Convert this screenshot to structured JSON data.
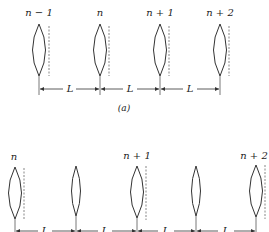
{
  "figure_a": {
    "caption": "(a)",
    "lenses": [
      {
        "label": "n − 1",
        "cx": 39,
        "dashed": true
      },
      {
        "label": "n",
        "cx": 100,
        "dashed": true
      },
      {
        "label": "n + 1",
        "cx": 160,
        "dashed": true
      },
      {
        "label": "n + 2",
        "cx": 220,
        "dashed": true
      }
    ],
    "spacing_label": "L",
    "spacing_count": 3
  },
  "figure_b": {
    "lenses": [
      {
        "label": "n",
        "cx": 15,
        "dashed": true
      },
      {
        "label": "",
        "cx": 76,
        "dashed": false
      },
      {
        "label": "n + 1",
        "cx": 137,
        "dashed": true
      },
      {
        "label": "",
        "cx": 196,
        "dashed": false
      },
      {
        "label": "n + 2",
        "cx": 256,
        "dashed": true
      }
    ],
    "spacing_label": "L",
    "spacing_count": 4
  },
  "colors": {
    "stroke": "#333333",
    "background": "#ffffff"
  }
}
